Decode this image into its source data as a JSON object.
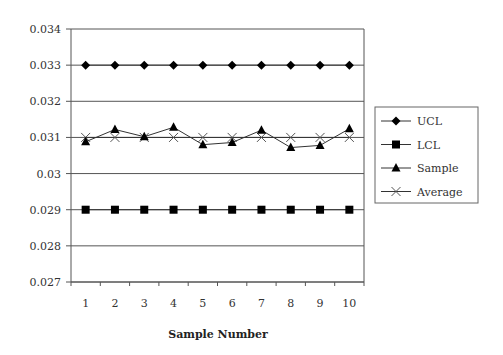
{
  "chart_data": {
    "type": "line",
    "title": "",
    "xlabel": "Sample Number",
    "ylabel": "",
    "ylim": [
      0.027,
      0.034
    ],
    "yticks": [
      "0.027",
      "0.028",
      "0.029",
      "0.03",
      "0.031",
      "0.032",
      "0.033",
      "0.034"
    ],
    "ytick_values": [
      0.027,
      0.028,
      0.029,
      0.03,
      0.031,
      0.032,
      0.033,
      0.034
    ],
    "categories": [
      "1",
      "2",
      "3",
      "4",
      "5",
      "6",
      "7",
      "8",
      "9",
      "10"
    ],
    "grid": "horizontal",
    "legend_position": "right",
    "series": [
      {
        "name": "UCL",
        "marker": "diamond",
        "values": [
          0.033,
          0.033,
          0.033,
          0.033,
          0.033,
          0.033,
          0.033,
          0.033,
          0.033,
          0.033
        ]
      },
      {
        "name": "LCL",
        "marker": "square",
        "values": [
          0.029,
          0.029,
          0.029,
          0.029,
          0.029,
          0.029,
          0.029,
          0.029,
          0.029,
          0.029
        ]
      },
      {
        "name": "Sample",
        "marker": "triangle",
        "values": [
          0.03088,
          0.03122,
          0.03102,
          0.03128,
          0.0308,
          0.03086,
          0.0312,
          0.03072,
          0.03078,
          0.03124
        ]
      },
      {
        "name": "Average",
        "marker": "x",
        "values": [
          0.031,
          0.031,
          0.031,
          0.031,
          0.031,
          0.031,
          0.031,
          0.031,
          0.031,
          0.031
        ]
      }
    ]
  },
  "colors": {
    "line": "#333333",
    "marker": "#000000",
    "grid": "#555555",
    "average_marker": "#555555",
    "legend_border": "#666666"
  }
}
